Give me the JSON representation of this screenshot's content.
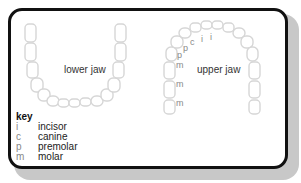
{
  "lower_jaw": {
    "label": "lower jaw"
  },
  "upper_jaw": {
    "label": "upper jaw",
    "tooth_labels": [
      "i",
      "i",
      "c",
      "p",
      "p",
      "m",
      "m",
      "m"
    ]
  },
  "key": {
    "title": "key",
    "items": [
      {
        "symbol": "i",
        "meaning": "incisor"
      },
      {
        "symbol": "c",
        "meaning": "canine"
      },
      {
        "symbol": "p",
        "meaning": "premolar"
      },
      {
        "symbol": "m",
        "meaning": "molar"
      }
    ]
  },
  "colors": {
    "border": "#111111",
    "tooth_outline": "#d9d9d9",
    "shadow": "#c8c8c8"
  }
}
